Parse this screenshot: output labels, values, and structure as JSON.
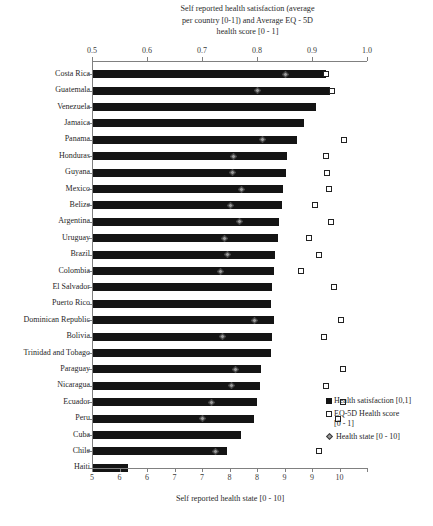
{
  "titles": {
    "top": "Self reported health satisfaction (average per country [0-1]) and Average EQ - 5D health score [0 - 1]",
    "top_line1": "Self reported health satisfaction (average",
    "top_line2": "per country [0-1]) and Average EQ - 5D",
    "top_line3": "health score [0 - 1]",
    "bottom": "Self reported health state [0 - 10]"
  },
  "legend": {
    "items": [
      {
        "key": "health-satisfaction",
        "marker": "filled-square",
        "label": "Health satisfaction [0,1]",
        "sub": ""
      },
      {
        "key": "eq5d-health-score",
        "marker": "open-square",
        "label": "EQ-5D Health score",
        "sub": "[0 - 1]"
      },
      {
        "key": "health-state",
        "marker": "diamond",
        "label": "Health state [0 - 10]",
        "sub": ""
      }
    ]
  },
  "chart_data": {
    "type": "bar",
    "title": "Self reported health satisfaction (average per country [0-1]) and Average EQ - 5D health score [0 - 1]",
    "xlabel": "Self reported health state [0 - 10]",
    "ylabel": "",
    "orientation": "horizontal",
    "grid": false,
    "legend_position": "bottom-right",
    "top_axis": {
      "label": "Self reported health satisfaction (average per country [0-1]) and Average EQ - 5D health score [0 - 1]",
      "ticks": [
        "0.5",
        "0.6",
        "0.7",
        "0.8",
        "0.9",
        "1.0"
      ],
      "tick_values": [
        0.5,
        0.6,
        0.7,
        0.8,
        0.9,
        1.0
      ],
      "range": [
        0.5,
        1.0
      ]
    },
    "bottom_axis": {
      "label": "Self reported health state [0 - 10]",
      "ticks": [
        "5",
        "6",
        "6",
        "7",
        "7",
        "8",
        "8",
        "9",
        "9",
        "10"
      ],
      "tick_values": [
        5.0,
        5.5,
        6.0,
        6.5,
        7.0,
        7.5,
        8.0,
        8.5,
        9.0,
        9.5,
        10.0
      ],
      "range": [
        5.0,
        10.0
      ]
    },
    "categories": [
      "Costa Rica",
      "Guatemala",
      "Venezuela",
      "Jamaica",
      "Panama",
      "Honduras",
      "Guyana",
      "Mexico",
      "Belize",
      "Argentina",
      "Uruguay",
      "Brazil",
      "Colombia",
      "El Salvador",
      "Puerto Rico",
      "Dominican Republic",
      "Bolivia",
      "Trinidad and Tobago",
      "Paraguay",
      "Nicaragua",
      "Ecuador",
      "Peru",
      "Cuba",
      "Chile",
      "Haiti"
    ],
    "series": [
      {
        "name": "Health satisfaction [0,1]",
        "marker": "filled-square",
        "axis": "top",
        "values": [
          0.925,
          0.933,
          0.908,
          0.885,
          0.872,
          0.855,
          0.853,
          0.848,
          0.845,
          0.84,
          0.838,
          0.833,
          0.83,
          0.827,
          0.825,
          0.83,
          0.827,
          0.825,
          0.808,
          0.805,
          0.8,
          0.795,
          0.77,
          0.745,
          0.565
        ]
      },
      {
        "name": "EQ-5D Health score [0 - 1]",
        "marker": "open-square",
        "axis": "top",
        "values": [
          0.925,
          0.937,
          null,
          null,
          0.958,
          0.925,
          0.928,
          0.93,
          0.905,
          0.935,
          0.895,
          0.912,
          0.88,
          0.94,
          null,
          0.952,
          0.922,
          null,
          0.957,
          0.925,
          0.957,
          0.948,
          null,
          0.913,
          null
        ]
      },
      {
        "name": "Health state [0 - 10]",
        "marker": "diamond",
        "axis": "bottom",
        "values": [
          8.52,
          8.0,
          null,
          null,
          8.1,
          7.58,
          7.56,
          7.72,
          7.52,
          7.68,
          7.4,
          7.47,
          7.33,
          null,
          null,
          7.95,
          7.38,
          null,
          7.6,
          7.54,
          7.17,
          7.0,
          null,
          7.25,
          null
        ]
      }
    ]
  }
}
